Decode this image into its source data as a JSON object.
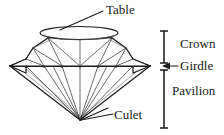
{
  "figure": {
    "background_color": "#ffffff",
    "line_color": "#1d1d1d",
    "text_color": "#1a1a1a"
  },
  "labels": {
    "table": "Table",
    "crown": "Crown",
    "girdle": "Girdle",
    "pavilion": "Pavilion",
    "culet": "Culet"
  },
  "annotations": {
    "table_leader": "leader-line-table",
    "culet_leader": "leader-line-culet",
    "girdle_arrow": "arrow-left-girdle",
    "crown_bracket": "bracket-crown",
    "pavilion_bracket": "bracket-pavilion"
  },
  "geometry": {
    "table_ellipse": {
      "cx": 79,
      "cy": 33,
      "rx": 39,
      "ry": 6.5
    },
    "girdle_y": 66,
    "girdle_left_x": 10,
    "girdle_right_x": 150,
    "culet": {
      "x": 80,
      "y": 120
    },
    "crown_bracket": {
      "x": 164,
      "top": 30,
      "bottom": 62
    },
    "pavilion_bracket": {
      "x": 164,
      "top": 70,
      "bottom": 128
    }
  }
}
